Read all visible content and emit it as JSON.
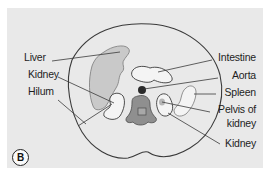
{
  "figure": {
    "panel_letter": "B",
    "labels_left": [
      {
        "id": "liver",
        "text": "Liver"
      },
      {
        "id": "kidney-left",
        "text": "Kidney"
      },
      {
        "id": "hilum",
        "text": "Hilum"
      }
    ],
    "labels_right": [
      {
        "id": "intestine",
        "text": "Intestine"
      },
      {
        "id": "aorta",
        "text": "Aorta"
      },
      {
        "id": "spleen",
        "text": "Spleen"
      },
      {
        "id": "pelvis-of-kidney",
        "text": "Pelvis of\nkidney",
        "line1": "Pelvis of",
        "line2": "kidney"
      },
      {
        "id": "kidney-right",
        "text": "Kidney"
      }
    ],
    "colors": {
      "panel_bg": "#e9e9e9",
      "outline": "#3a3a3a",
      "liver_fill": "#c9c9c9",
      "organ_fill_light": "#f4f4f4",
      "vertebra_fill": "#8f8f8f",
      "aorta_fill": "#2a2a2a"
    }
  }
}
